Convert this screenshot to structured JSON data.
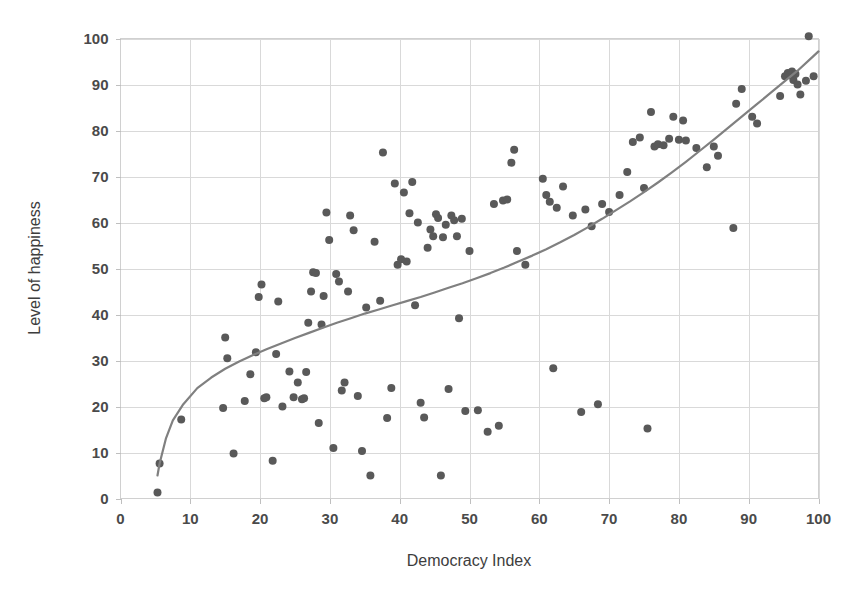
{
  "chart_data": {
    "type": "scatter",
    "title": "",
    "xlabel": "Democracy Index",
    "ylabel": "Level of happiness",
    "xlim": [
      0,
      100
    ],
    "ylim": [
      0,
      100
    ],
    "xticks": [
      0,
      10,
      20,
      30,
      40,
      50,
      60,
      70,
      80,
      90,
      100
    ],
    "yticks": [
      0,
      10,
      20,
      30,
      40,
      50,
      60,
      70,
      80,
      90,
      100
    ],
    "xtick_labels": [
      "0",
      "10",
      "20",
      "30",
      "40",
      "50",
      "60",
      "70",
      "80",
      "90",
      "100"
    ],
    "ytick_labels": [
      "0",
      "10",
      "20",
      "30",
      "40",
      "50",
      "60",
      "70",
      "80",
      "90",
      "100"
    ],
    "grid": true,
    "legend": false,
    "legend_position": "none",
    "marker_color": "#595959",
    "marker_size": 8,
    "trend_line": {
      "label": "fitted trend curve",
      "color": "#808080",
      "points": [
        [
          5.3,
          5.0
        ],
        [
          5.6,
          7.6
        ],
        [
          6.5,
          13.0
        ],
        [
          7.5,
          17.0
        ],
        [
          9.0,
          20.5
        ],
        [
          11.0,
          24.0
        ],
        [
          13.0,
          26.3
        ],
        [
          15.0,
          28.2
        ],
        [
          17.0,
          29.8
        ],
        [
          19.0,
          31.2
        ],
        [
          21.0,
          32.5
        ],
        [
          23.0,
          33.7
        ],
        [
          25.0,
          34.9
        ],
        [
          27.0,
          36.0
        ],
        [
          29.0,
          37.1
        ],
        [
          31.0,
          38.2
        ],
        [
          33.0,
          39.2
        ],
        [
          35.0,
          40.2
        ],
        [
          37.0,
          41.1
        ],
        [
          39.0,
          42.0
        ],
        [
          41.0,
          42.9
        ],
        [
          43.0,
          43.8
        ],
        [
          45.0,
          44.8
        ],
        [
          47.0,
          45.8
        ],
        [
          49.0,
          46.8
        ],
        [
          51.0,
          47.9
        ],
        [
          53.0,
          49.0
        ],
        [
          55.0,
          50.2
        ],
        [
          57.0,
          51.5
        ],
        [
          59.0,
          52.8
        ],
        [
          61.0,
          54.2
        ],
        [
          63.0,
          55.7
        ],
        [
          65.0,
          57.3
        ],
        [
          67.0,
          59.0
        ],
        [
          69.0,
          60.8
        ],
        [
          71.0,
          62.7
        ],
        [
          73.0,
          64.6
        ],
        [
          75.0,
          66.6
        ],
        [
          77.0,
          68.7
        ],
        [
          79.0,
          70.9
        ],
        [
          81.0,
          73.2
        ],
        [
          83.0,
          75.6
        ],
        [
          85.0,
          78.0
        ],
        [
          87.0,
          80.5
        ],
        [
          89.0,
          83.0
        ],
        [
          91.0,
          85.5
        ],
        [
          93.0,
          88.0
        ],
        [
          95.0,
          90.5
        ],
        [
          97.0,
          93.0
        ],
        [
          99.0,
          95.8
        ],
        [
          100.0,
          97.2
        ]
      ]
    },
    "points": [
      [
        5.3,
        1.3
      ],
      [
        5.6,
        7.6
      ],
      [
        8.7,
        17.2
      ],
      [
        14.7,
        19.7
      ],
      [
        15.0,
        35.0
      ],
      [
        15.3,
        30.5
      ],
      [
        16.2,
        9.8
      ],
      [
        17.8,
        21.2
      ],
      [
        18.6,
        27.0
      ],
      [
        19.4,
        31.8
      ],
      [
        19.8,
        43.8
      ],
      [
        20.2,
        46.5
      ],
      [
        20.6,
        21.8
      ],
      [
        20.9,
        22.0
      ],
      [
        21.8,
        8.2
      ],
      [
        22.3,
        31.4
      ],
      [
        22.6,
        42.8
      ],
      [
        23.2,
        20.0
      ],
      [
        24.2,
        27.6
      ],
      [
        24.8,
        22.0
      ],
      [
        25.4,
        25.2
      ],
      [
        26.0,
        21.6
      ],
      [
        26.3,
        21.8
      ],
      [
        26.6,
        27.5
      ],
      [
        26.9,
        38.2
      ],
      [
        27.3,
        45.0
      ],
      [
        27.6,
        49.2
      ],
      [
        28.0,
        49.0
      ],
      [
        28.4,
        16.4
      ],
      [
        28.8,
        37.8
      ],
      [
        29.1,
        44.0
      ],
      [
        29.5,
        62.2
      ],
      [
        29.9,
        56.2
      ],
      [
        30.5,
        11.0
      ],
      [
        30.9,
        48.8
      ],
      [
        31.3,
        47.2
      ],
      [
        31.7,
        23.5
      ],
      [
        32.1,
        25.2
      ],
      [
        32.6,
        45.0
      ],
      [
        32.9,
        61.5
      ],
      [
        33.4,
        58.3
      ],
      [
        34.0,
        22.3
      ],
      [
        34.6,
        10.3
      ],
      [
        35.2,
        41.5
      ],
      [
        35.8,
        5.0
      ],
      [
        36.4,
        55.8
      ],
      [
        37.2,
        43.0
      ],
      [
        37.6,
        75.2
      ],
      [
        38.2,
        17.5
      ],
      [
        38.8,
        24.0
      ],
      [
        39.3,
        68.5
      ],
      [
        39.7,
        50.8
      ],
      [
        40.2,
        52.0
      ],
      [
        40.6,
        66.5
      ],
      [
        41.0,
        51.5
      ],
      [
        41.4,
        62.0
      ],
      [
        41.8,
        68.8
      ],
      [
        42.2,
        42.0
      ],
      [
        42.6,
        60.0
      ],
      [
        43.0,
        20.8
      ],
      [
        43.5,
        17.6
      ],
      [
        44.0,
        54.5
      ],
      [
        44.4,
        58.5
      ],
      [
        44.8,
        57.0
      ],
      [
        45.2,
        61.8
      ],
      [
        45.5,
        61.0
      ],
      [
        45.9,
        5.0
      ],
      [
        46.2,
        56.8
      ],
      [
        46.6,
        59.5
      ],
      [
        47.0,
        23.8
      ],
      [
        47.4,
        61.5
      ],
      [
        47.8,
        60.5
      ],
      [
        48.2,
        57.0
      ],
      [
        48.5,
        39.2
      ],
      [
        48.9,
        60.8
      ],
      [
        49.4,
        19.0
      ],
      [
        50.0,
        53.8
      ],
      [
        51.2,
        19.2
      ],
      [
        52.6,
        14.5
      ],
      [
        53.5,
        64.0
      ],
      [
        54.2,
        15.8
      ],
      [
        54.8,
        64.8
      ],
      [
        55.4,
        65.0
      ],
      [
        56.0,
        73.0
      ],
      [
        56.4,
        75.8
      ],
      [
        56.8,
        53.8
      ],
      [
        58.0,
        50.8
      ],
      [
        60.5,
        69.5
      ],
      [
        61.0,
        66.0
      ],
      [
        61.5,
        64.5
      ],
      [
        62.0,
        28.3
      ],
      [
        62.5,
        63.2
      ],
      [
        63.4,
        67.8
      ],
      [
        64.8,
        61.5
      ],
      [
        66.0,
        18.8
      ],
      [
        66.6,
        62.8
      ],
      [
        67.5,
        59.2
      ],
      [
        68.4,
        20.5
      ],
      [
        69.0,
        64.0
      ],
      [
        70.0,
        62.3
      ],
      [
        71.5,
        66.0
      ],
      [
        72.6,
        71.0
      ],
      [
        73.4,
        77.5
      ],
      [
        74.4,
        78.5
      ],
      [
        75.0,
        67.5
      ],
      [
        75.5,
        15.2
      ],
      [
        76.0,
        84.0
      ],
      [
        76.5,
        76.5
      ],
      [
        77.0,
        77.0
      ],
      [
        77.8,
        76.8
      ],
      [
        78.6,
        78.2
      ],
      [
        79.2,
        83.0
      ],
      [
        80.0,
        78.0
      ],
      [
        80.6,
        82.2
      ],
      [
        81.0,
        77.8
      ],
      [
        82.5,
        76.2
      ],
      [
        84.0,
        72.0
      ],
      [
        85.0,
        76.5
      ],
      [
        85.6,
        74.5
      ],
      [
        87.8,
        58.8
      ],
      [
        88.2,
        85.8
      ],
      [
        89.0,
        89.0
      ],
      [
        90.5,
        83.0
      ],
      [
        91.2,
        81.5
      ],
      [
        94.5,
        87.5
      ],
      [
        95.2,
        91.8
      ],
      [
        95.6,
        92.5
      ],
      [
        95.9,
        92.0
      ],
      [
        96.2,
        92.8
      ],
      [
        96.4,
        91.0
      ],
      [
        96.7,
        92.3
      ],
      [
        97.0,
        90.0
      ],
      [
        97.4,
        87.8
      ],
      [
        98.2,
        90.8
      ],
      [
        98.6,
        100.5
      ],
      [
        99.3,
        91.8
      ]
    ]
  }
}
